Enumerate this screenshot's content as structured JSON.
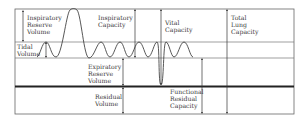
{
  "diagram": {
    "colors": {
      "line": "#555555",
      "thick_line": "#222222",
      "text": "#3a3a3a",
      "background": "#ffffff"
    },
    "labels": {
      "inspiratory_reserve_volume": "Inspiratory\nReserve\nVolume",
      "tidal_volume": "Tidal\nVolume",
      "inspiratory_capacity": "Inspiratory\nCapacity",
      "vital_capacity": "Vital\nCapacity",
      "total_lung_capacity": "Total\nLung\nCapacity",
      "expiratory_reserve_volume": "Expiratory\nReserve\nVolume",
      "residual_volume": "Residual\nVolume",
      "functional_residual_capacity": "Functional\nResidual\nCapacity"
    }
  }
}
